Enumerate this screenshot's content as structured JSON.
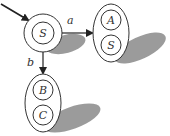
{
  "diagram": {
    "type": "state-transition",
    "colors": {
      "stroke": "#333333",
      "shadow": "#8a8a8a",
      "fill": "#ffffff"
    },
    "start_arrow": {
      "target": "S"
    },
    "nodes": [
      {
        "id": "start",
        "states": [
          "S"
        ]
      },
      {
        "id": "right",
        "states": [
          "A",
          "S"
        ]
      },
      {
        "id": "bottom",
        "states": [
          "B",
          "C"
        ]
      }
    ],
    "edges": [
      {
        "from": "start",
        "to": "right",
        "label": "a"
      },
      {
        "from": "start",
        "to": "bottom",
        "label": "b"
      }
    ]
  }
}
